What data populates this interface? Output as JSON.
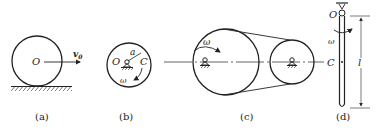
{
  "figures": [
    {
      "id": "a",
      "caption": "(a)",
      "description": "Disk rolling on ground with center velocity",
      "labels": {
        "center": "O",
        "velocity": "v",
        "velocity_sub": "0"
      }
    },
    {
      "id": "b",
      "caption": "(b)",
      "description": "Disk rotating about fixed pivot O with center of mass C at distance a",
      "labels": {
        "pivot": "O",
        "distance": "a",
        "mass_center": "C",
        "angular_velocity": "ω"
      }
    },
    {
      "id": "c",
      "caption": "(c)",
      "description": "Two pulleys connected by belt, driving pulley rotating",
      "labels": {
        "angular_velocity": "ω"
      }
    },
    {
      "id": "d",
      "caption": "(d)",
      "description": "Slender rod of length l pivoted at top end O",
      "labels": {
        "pivot": "O",
        "angular_velocity": "ω",
        "mass_center": "C",
        "length": "l"
      }
    }
  ],
  "colors": {
    "line": "#222222",
    "background": "#ffffff"
  }
}
